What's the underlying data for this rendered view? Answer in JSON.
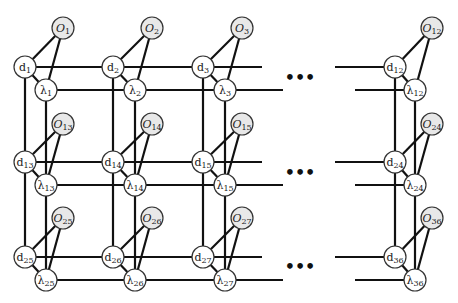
{
  "colors": {
    "edge": "#111111",
    "node_fill_white": "#ffffff",
    "node_fill_gray": "#e8e8e8",
    "node_stroke": "#333333"
  },
  "columns": [
    {
      "d_x": 25,
      "l_x": 46,
      "o_x": 63
    },
    {
      "d_x": 113,
      "l_x": 135,
      "o_x": 152
    },
    {
      "d_x": 203,
      "l_x": 225,
      "o_x": 242
    },
    {
      "d_x": 395,
      "l_x": 415,
      "o_x": 432
    }
  ],
  "rows": [
    {
      "o_y": 28,
      "d_y": 67,
      "l_y": 90
    },
    {
      "o_y": 124,
      "d_y": 162,
      "l_y": 185
    },
    {
      "o_y": 218,
      "d_y": 257,
      "l_y": 280
    }
  ],
  "nodes": [
    {
      "row": 0,
      "col": 0,
      "d": "d",
      "d_sub": "1",
      "l": "λ",
      "l_sub": "1",
      "o": "O",
      "o_sub": "1"
    },
    {
      "row": 0,
      "col": 1,
      "d": "d",
      "d_sub": "2",
      "l": "λ",
      "l_sub": "2",
      "o": "O",
      "o_sub": "2"
    },
    {
      "row": 0,
      "col": 2,
      "d": "d",
      "d_sub": "3",
      "l": "λ",
      "l_sub": "3",
      "o": "O",
      "o_sub": "3"
    },
    {
      "row": 0,
      "col": 3,
      "d": "d",
      "d_sub": "12",
      "l": "λ",
      "l_sub": "12",
      "o": "O",
      "o_sub": "12"
    },
    {
      "row": 1,
      "col": 0,
      "d": "d",
      "d_sub": "13",
      "l": "λ",
      "l_sub": "13",
      "o": "O",
      "o_sub": "13"
    },
    {
      "row": 1,
      "col": 1,
      "d": "d",
      "d_sub": "14",
      "l": "λ",
      "l_sub": "14",
      "o": "O",
      "o_sub": "14"
    },
    {
      "row": 1,
      "col": 2,
      "d": "d",
      "d_sub": "15",
      "l": "λ",
      "l_sub": "15",
      "o": "O",
      "o_sub": "15"
    },
    {
      "row": 1,
      "col": 3,
      "d": "d",
      "d_sub": "24",
      "l": "λ",
      "l_sub": "24",
      "o": "O",
      "o_sub": "24"
    },
    {
      "row": 2,
      "col": 0,
      "d": "d",
      "d_sub": "25",
      "l": "λ",
      "l_sub": "25",
      "o": "O",
      "o_sub": "25"
    },
    {
      "row": 2,
      "col": 1,
      "d": "d",
      "d_sub": "26",
      "l": "λ",
      "l_sub": "26",
      "o": "O",
      "o_sub": "26"
    },
    {
      "row": 2,
      "col": 2,
      "d": "d",
      "d_sub": "27",
      "l": "λ",
      "l_sub": "27",
      "o": "O",
      "o_sub": "27"
    },
    {
      "row": 2,
      "col": 3,
      "d": "d",
      "d_sub": "36",
      "l": "λ",
      "l_sub": "36",
      "o": "O",
      "o_sub": "36"
    }
  ],
  "ellipsis": "•••",
  "ellipsis_positions": [
    {
      "x": 300,
      "y": 83
    },
    {
      "x": 300,
      "y": 178
    },
    {
      "x": 300,
      "y": 272
    }
  ]
}
